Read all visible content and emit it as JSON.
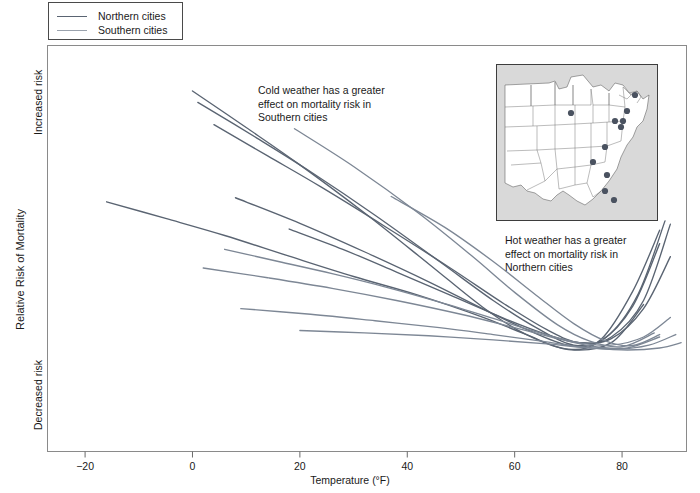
{
  "figure": {
    "background": "#ffffff",
    "frame_color": "#8a8a8a"
  },
  "legend": {
    "position": "top-left",
    "items": [
      {
        "label": "Northern cities",
        "color": "#5a6472"
      },
      {
        "label": "Southern cities",
        "color": "#9aa2ad"
      }
    ]
  },
  "annotations": [
    {
      "name": "cold-weather-note",
      "text": "Cold weather has a greater\neffect on mortality risk in\nSouthern cities"
    },
    {
      "name": "hot-weather-note",
      "text": "Hot weather has a greater\neffect on mortality risk in\nNorthern cities"
    }
  ],
  "axes": {
    "x": {
      "title": "Temperature (°F)",
      "ticks": [
        "−20",
        "0",
        "20",
        "40",
        "60",
        "80"
      ],
      "tick_values": [
        -20,
        0,
        20,
        40,
        60,
        80
      ],
      "range": [
        -27,
        92
      ]
    },
    "y": {
      "title": "Relative Risk of Mortality",
      "labels": {
        "high": "Increased risk",
        "low": "Decreased risk"
      },
      "range": [
        0,
        1
      ]
    }
  },
  "map_inset": {
    "name": "us-map-inset",
    "background": "#d9d9d9",
    "land_fill": "#ffffff",
    "border_color": "#3d3d3d",
    "city_dot_color": "#4a5260",
    "city_dot_count": 11
  },
  "chart_data": {
    "type": "line",
    "title": "",
    "xlabel": "Temperature (°F)",
    "ylabel": "Relative Risk of Mortality",
    "xlim": [
      -27,
      92
    ],
    "ylim": [
      0,
      1
    ],
    "grid": false,
    "legend_position": "top-left",
    "y_axis_note": "Unitless relative risk; only qualitative endpoints 'Increased risk' and 'Decreased risk' are labeled",
    "series": [
      {
        "name": "Northern city 1",
        "group": "Northern cities",
        "color": "#5a6472",
        "x": [
          -16,
          -5,
          6,
          18,
          30,
          42,
          54,
          62,
          70,
          78,
          84
        ],
        "y": [
          0.615,
          0.574,
          0.532,
          0.481,
          0.431,
          0.385,
          0.331,
          0.289,
          0.251,
          0.268,
          0.362
        ]
      },
      {
        "name": "Northern city 2",
        "group": "Northern cities",
        "color": "#5a6472",
        "x": [
          0,
          10,
          20,
          32,
          44,
          54,
          62,
          70,
          76,
          82,
          87
        ],
        "y": [
          0.888,
          0.798,
          0.706,
          0.588,
          0.462,
          0.356,
          0.289,
          0.252,
          0.275,
          0.395,
          0.545
        ]
      },
      {
        "name": "Northern city 3",
        "group": "Northern cities",
        "color": "#5a6472",
        "x": [
          1,
          12,
          22,
          34,
          46,
          56,
          64,
          71,
          77,
          83,
          88
        ],
        "y": [
          0.86,
          0.772,
          0.689,
          0.582,
          0.468,
          0.372,
          0.305,
          0.262,
          0.281,
          0.388,
          0.568
        ]
      },
      {
        "name": "Northern city 4",
        "group": "Northern cities",
        "color": "#5a6472",
        "x": [
          4,
          14,
          24,
          36,
          48,
          58,
          66,
          72,
          78,
          84,
          89
        ],
        "y": [
          0.805,
          0.728,
          0.651,
          0.553,
          0.452,
          0.364,
          0.3,
          0.268,
          0.282,
          0.372,
          0.56
        ]
      },
      {
        "name": "Northern city 5",
        "group": "Northern cities",
        "color": "#5a6472",
        "x": [
          8,
          20,
          32,
          44,
          54,
          62,
          70,
          76,
          82,
          87
        ],
        "y": [
          0.625,
          0.562,
          0.492,
          0.418,
          0.352,
          0.302,
          0.262,
          0.272,
          0.358,
          0.512
        ]
      },
      {
        "name": "Northern city 6",
        "group": "Northern cities",
        "color": "#5a6472",
        "x": [
          18,
          28,
          38,
          48,
          58,
          66,
          72,
          78,
          84,
          89
        ],
        "y": [
          0.548,
          0.498,
          0.442,
          0.385,
          0.328,
          0.288,
          0.268,
          0.278,
          0.352,
          0.48
        ]
      },
      {
        "name": "Southern city 1",
        "group": "Southern cities",
        "color": "#7d8795",
        "x": [
          19,
          30,
          42,
          52,
          60,
          68,
          74,
          80,
          86
        ],
        "y": [
          0.795,
          0.702,
          0.588,
          0.482,
          0.392,
          0.312,
          0.272,
          0.258,
          0.292
        ]
      },
      {
        "name": "Southern city 2",
        "group": "Southern cities",
        "color": "#7d8795",
        "x": [
          37,
          47,
          56,
          64,
          71,
          77,
          82,
          87
        ],
        "y": [
          0.628,
          0.552,
          0.468,
          0.385,
          0.315,
          0.272,
          0.261,
          0.288
        ]
      },
      {
        "name": "Southern city 3",
        "group": "Southern cities",
        "color": "#7d8795",
        "x": [
          6,
          16,
          26,
          36,
          46,
          56,
          64,
          72,
          78,
          84,
          89
        ],
        "y": [
          0.498,
          0.468,
          0.438,
          0.405,
          0.368,
          0.328,
          0.295,
          0.268,
          0.262,
          0.282,
          0.33
        ]
      },
      {
        "name": "Southern city 4",
        "group": "Southern cities",
        "color": "#7d8795",
        "x": [
          2,
          14,
          26,
          38,
          50,
          60,
          68,
          75,
          81,
          87
        ],
        "y": [
          0.452,
          0.428,
          0.402,
          0.372,
          0.338,
          0.305,
          0.278,
          0.258,
          0.255,
          0.282
        ]
      },
      {
        "name": "Southern city 5",
        "group": "Southern cities",
        "color": "#7d8795",
        "x": [
          9,
          22,
          34,
          46,
          56,
          65,
          72,
          79,
          85,
          90
        ],
        "y": [
          0.352,
          0.338,
          0.322,
          0.305,
          0.288,
          0.272,
          0.258,
          0.252,
          0.262,
          0.288
        ]
      },
      {
        "name": "Southern city 6",
        "group": "Southern cities",
        "color": "#7d8795",
        "x": [
          20,
          32,
          44,
          56,
          66,
          74,
          81,
          87,
          91
        ],
        "y": [
          0.298,
          0.292,
          0.285,
          0.275,
          0.265,
          0.255,
          0.25,
          0.255,
          0.268
        ]
      }
    ]
  }
}
